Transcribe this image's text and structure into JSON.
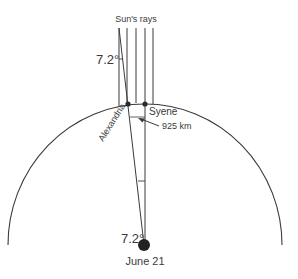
{
  "diagram": {
    "labels": {
      "sun_rays": "Sun's rays",
      "angle_top": "7.2°",
      "angle_center": "7.2°",
      "alexandria": "Alexandria",
      "syene": "Syene",
      "distance": "925 km",
      "date": "June 21"
    },
    "colors": {
      "stroke": "#3a3a3a",
      "background": "#ffffff"
    },
    "geometry": {
      "earth_center": [
        144,
        245
      ],
      "rays_x": [
        119,
        127,
        136,
        145,
        153
      ],
      "rays_top_y": 28,
      "surface_y": 104,
      "alexandria_point": [
        128,
        104
      ],
      "syene_point": [
        145,
        104
      ]
    }
  }
}
